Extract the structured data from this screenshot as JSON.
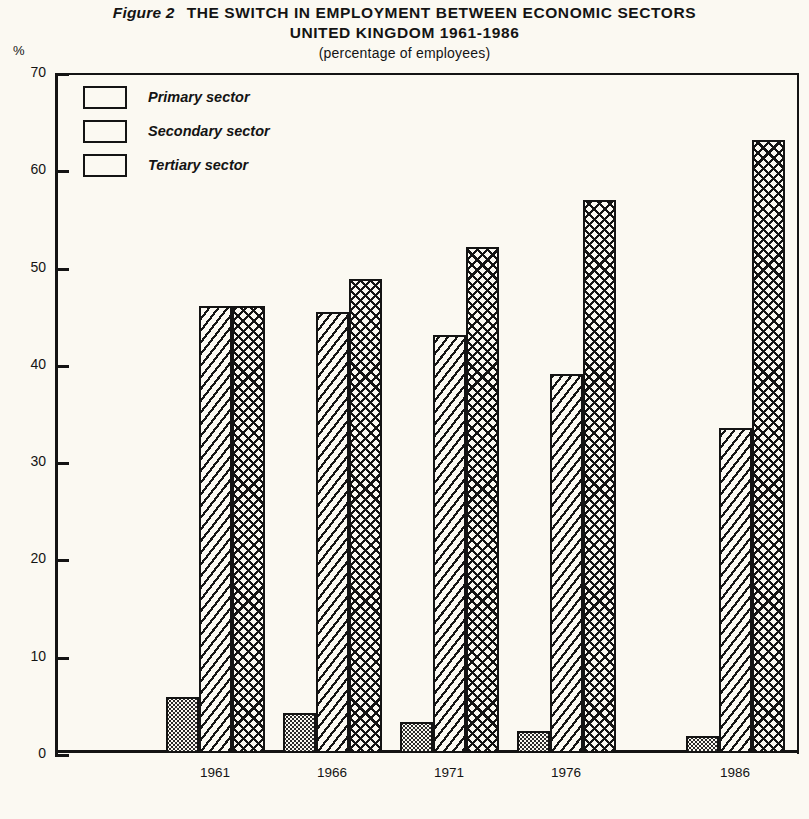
{
  "figure": {
    "figure_label": "Figure 2",
    "title_line1": "THE SWITCH IN EMPLOYMENT BETWEEN ECONOMIC SECTORS",
    "title_line2": "UNITED KINGDOM 1961-1986",
    "subtitle": "(percentage of employees)",
    "y_axis_unit": "%"
  },
  "legend": {
    "items": [
      {
        "label": "Primary sector",
        "pattern": "dotted"
      },
      {
        "label": "Secondary sector",
        "pattern": "diagonal-hatch"
      },
      {
        "label": "Tertiary sector",
        "pattern": "cross-hatch"
      }
    ]
  },
  "axis": {
    "y_ticks": [
      "70",
      "60",
      "50",
      "40",
      "30",
      "20",
      "10",
      "0"
    ],
    "x_ticks": [
      "1961",
      "1966",
      "1971",
      "1976",
      "1986"
    ]
  },
  "chart_data": {
    "type": "bar",
    "subtitle": "(percentage of employees)",
    "xlabel": "",
    "ylabel": "%",
    "ylim": [
      0,
      70
    ],
    "ytick_step": 10,
    "grid": false,
    "legend_position": "top-left",
    "categories": [
      "1961",
      "1966",
      "1971",
      "1976",
      "1986"
    ],
    "series": [
      {
        "name": "Primary sector",
        "values": [
          5.8,
          4.1,
          3.2,
          2.3,
          1.8
        ]
      },
      {
        "name": "Secondary sector",
        "values": [
          46.0,
          45.3,
          43.0,
          39.0,
          33.4
        ]
      },
      {
        "name": "Tertiary sector",
        "values": [
          46.0,
          48.7,
          52.0,
          56.8,
          63.0
        ]
      }
    ]
  },
  "colors": {
    "ink": "#141414",
    "paper": "#fbf9f2"
  }
}
